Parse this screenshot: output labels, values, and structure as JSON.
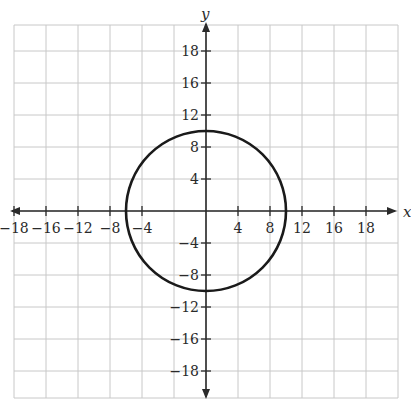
{
  "chart_data": {
    "type": "line",
    "title": "",
    "xlabel": "x",
    "ylabel": "y",
    "xlim": [
      -20,
      20
    ],
    "ylim": [
      -20,
      20
    ],
    "grid": true,
    "x_tick_labels": [
      "−18",
      "−16",
      "−12",
      "−8",
      "−4",
      "4",
      "8",
      "12",
      "16",
      "18"
    ],
    "y_tick_labels": [
      "18",
      "16",
      "12",
      "8",
      "4",
      "−4",
      "−8",
      "−12",
      "−16",
      "−18"
    ],
    "series": [
      {
        "name": "circle",
        "equation": "x^2 + y^2 = 100",
        "center": [
          0,
          0
        ],
        "radius": 10,
        "color": "#1a1a1a"
      }
    ],
    "legend": null
  },
  "colors": {
    "grid": "#c8c8c8",
    "axis": "#2a2a2a",
    "curve": "#1a1a1a"
  }
}
